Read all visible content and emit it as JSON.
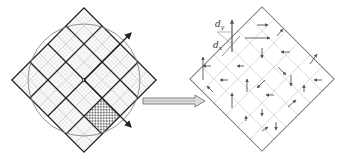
{
  "diagram": {
    "left_panel": {
      "description": "Circle inscribed region covered by a rotated square grid (4x4 bold blocks, each subdivided into fine hatched cells); one block checkered; two outward arrows at top-right and bottom-right",
      "bold_grid": 4,
      "fine_subdivisions": 8,
      "highlighted_block": "checkered block on the right"
    },
    "transition_arrow": {
      "direction": "right",
      "style": "double-line hollow arrow"
    },
    "right_panel": {
      "description": "Rotated square grid (6x6) with a displacement vector arrow in each cell",
      "grid_size": 6,
      "labels": {
        "dy_main": "d",
        "dy_sub": "y",
        "dx_main": "d",
        "dx_sub": "x"
      }
    },
    "colors": {
      "bold_line": "#222222",
      "fine_line": "#b8b8b8",
      "circle": "#888888",
      "arrow": "#555555",
      "grid_right": "#cccccc",
      "border_right": "#777777"
    }
  }
}
